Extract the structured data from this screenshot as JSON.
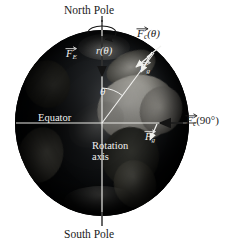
{
  "figure": {
    "globe_colors": {
      "ocean_dark": "#0c0e10",
      "land_light": "#e8e6df",
      "overlay_line": "#e8e8e4",
      "label_dark": "#1a1a1a",
      "label_light": "#f2f2f0"
    }
  },
  "labels": {
    "north_pole": "North Pole",
    "south_pole": "South Pole",
    "equator": "Equator",
    "rotation_axis_line1": "Rotation",
    "rotation_axis_line2": "axis",
    "angle_theta": "θ",
    "radius": {
      "symbol": "r",
      "arg": "(θ)"
    },
    "force_earth": {
      "symbol": "F",
      "sub": "E"
    },
    "force_gravity_upper": {
      "symbol": "F",
      "sub": "g"
    },
    "force_gravity_lower": {
      "symbol": "F",
      "sub": "g"
    },
    "force_centripetal_theta": {
      "symbol": "F",
      "sub": "c",
      "arg": "(θ)"
    },
    "force_centripetal_90": {
      "symbol": "F",
      "sub": "c",
      "arg": "(90°)"
    }
  },
  "geometry": {
    "globe_center_x": 102,
    "globe_center_y": 123,
    "globe_radius_x": 87,
    "globe_radius_y": 93,
    "theta_degrees": 37
  }
}
